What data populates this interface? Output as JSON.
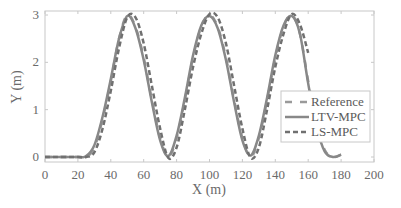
{
  "chart_data": {
    "type": "line",
    "title": "",
    "xlabel": "X (m)",
    "ylabel": "Y (m)",
    "xlim": [
      0,
      200
    ],
    "ylim": [
      -0.03,
      3.1
    ],
    "xticks": [
      0,
      20,
      40,
      60,
      80,
      100,
      120,
      140,
      160,
      180,
      200
    ],
    "yticks": [
      0,
      1,
      2,
      3
    ],
    "grid": false,
    "legend_position": "lower right (inside)",
    "series": [
      {
        "name": "Reference",
        "style": "dashed",
        "color": "#9a9a9a",
        "x": [
          0,
          20,
          25,
          30,
          35,
          40,
          45,
          50,
          55,
          60,
          65,
          70,
          75,
          80,
          85,
          90,
          95,
          100,
          105,
          110,
          115,
          120,
          125,
          130,
          135,
          140,
          145,
          150,
          155,
          160,
          165,
          170,
          175,
          180
        ],
        "y": [
          0.0,
          0.0,
          0.0,
          0.2,
          0.8,
          1.6,
          2.5,
          3.0,
          2.75,
          2.1,
          1.2,
          0.4,
          0.0,
          0.4,
          1.2,
          2.1,
          2.75,
          3.0,
          2.75,
          2.1,
          1.2,
          0.4,
          0.0,
          0.4,
          1.2,
          2.1,
          2.75,
          3.0,
          2.6,
          1.6,
          0.7,
          0.15,
          0.0,
          0.05
        ]
      },
      {
        "name": "LTV-MPC",
        "style": "solid",
        "color": "#888888",
        "x": [
          0,
          20,
          25,
          30,
          35,
          40,
          45,
          50,
          55,
          60,
          65,
          70,
          75,
          80,
          85,
          90,
          95,
          100,
          105,
          110,
          115,
          120,
          125,
          130,
          135,
          140,
          145,
          150,
          155,
          160,
          165,
          170,
          175,
          180
        ],
        "y": [
          0.0,
          0.0,
          0.02,
          0.25,
          0.85,
          1.65,
          2.5,
          2.98,
          2.72,
          2.05,
          1.15,
          0.35,
          0.02,
          0.45,
          1.25,
          2.15,
          2.78,
          2.98,
          2.72,
          2.05,
          1.15,
          0.35,
          0.03,
          0.45,
          1.25,
          2.15,
          2.78,
          2.98,
          2.6,
          1.55,
          0.65,
          0.12,
          0.0,
          0.05
        ]
      },
      {
        "name": "LS-MPC",
        "style": "dash-dot",
        "color": "#707070",
        "x": [
          0,
          20,
          25,
          30,
          35,
          40,
          45,
          50,
          55,
          60,
          65,
          70,
          75,
          80,
          85,
          90,
          95,
          100,
          105,
          110,
          115,
          120,
          125,
          130,
          135,
          140,
          145,
          150,
          155,
          160
        ],
        "y": [
          0.0,
          0.0,
          0.0,
          0.1,
          0.6,
          1.4,
          2.3,
          2.95,
          2.95,
          2.4,
          1.5,
          0.6,
          -0.02,
          0.2,
          1.0,
          1.9,
          2.6,
          3.02,
          2.95,
          2.4,
          1.5,
          0.6,
          -0.02,
          0.2,
          1.0,
          1.9,
          2.6,
          3.02,
          2.8,
          2.2
        ]
      }
    ]
  },
  "legend": {
    "items": [
      {
        "label": "Reference",
        "style": "dashed"
      },
      {
        "label": "LTV-MPC",
        "style": "solid"
      },
      {
        "label": "LS-MPC",
        "style": "dash-dot"
      }
    ]
  },
  "axes": {
    "x_tick_labels": [
      "0",
      "20",
      "40",
      "60",
      "80",
      "100",
      "120",
      "140",
      "160",
      "180",
      "200"
    ],
    "y_tick_labels": [
      "0",
      "1",
      "2",
      "3"
    ]
  }
}
